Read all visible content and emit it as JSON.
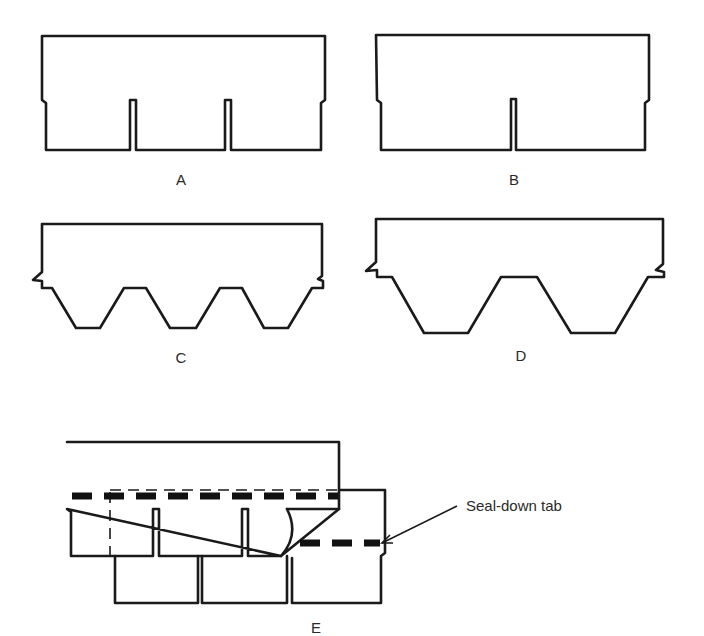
{
  "figures": [
    {
      "id": "A",
      "label": "A",
      "description": "Three-tab square-butt shingle"
    },
    {
      "id": "B",
      "label": "B",
      "description": "Two-tab square-butt shingle"
    },
    {
      "id": "C",
      "label": "C",
      "description": "Three-tab hexagonal shingle"
    },
    {
      "id": "D",
      "label": "D",
      "description": "Two-tab hexagonal shingle"
    },
    {
      "id": "E",
      "label": "E",
      "description": "Overlapping shingles with seal-down tab"
    }
  ],
  "callout": {
    "text": "Seal-down tab"
  },
  "colors": {
    "line": "#1a1a1a",
    "background": "#ffffff",
    "text": "#2a2a2a"
  }
}
